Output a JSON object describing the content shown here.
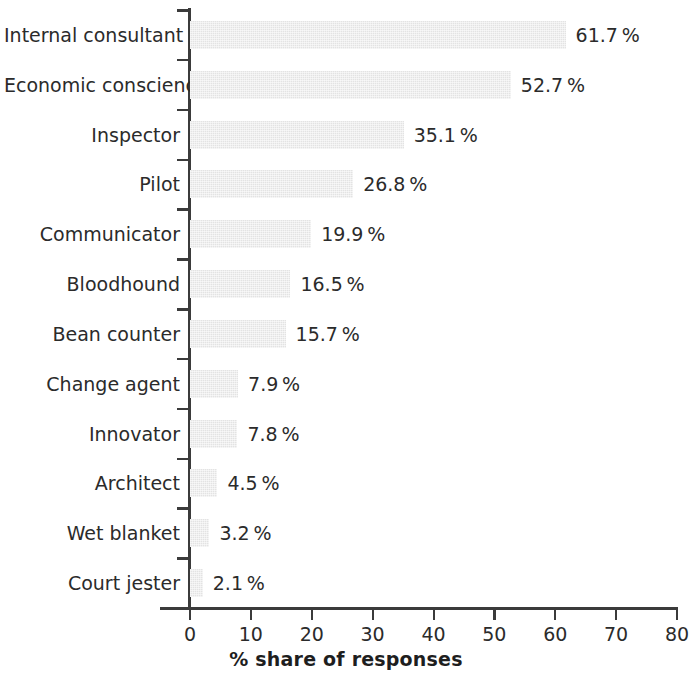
{
  "chart_data": {
    "type": "bar",
    "orientation": "horizontal",
    "title": "",
    "subtitle": "",
    "xlabel": "% share of responses",
    "ylabel": "",
    "xlim": [
      0,
      80
    ],
    "x_ticks": [
      0,
      10,
      20,
      30,
      40,
      50,
      60,
      70,
      80
    ],
    "x_tick_labels": [
      "0",
      "10",
      "20",
      "30",
      "40",
      "50",
      "60",
      "70",
      "80"
    ],
    "grid": false,
    "legend": null,
    "value_label_suffix": "%",
    "categories": [
      "Internal consultant",
      "Economic conscience",
      "Inspector",
      "Pilot",
      "Communicator",
      "Bloodhound",
      "Bean counter",
      "Change agent",
      "Innovator",
      "Architect",
      "Wet blanket",
      "Court jester"
    ],
    "values": [
      61.7,
      52.7,
      35.1,
      26.8,
      19.9,
      16.5,
      15.7,
      7.9,
      7.8,
      4.5,
      3.2,
      2.1
    ],
    "value_labels": [
      "61.7 %",
      "52.7 %",
      "35.1 %",
      "26.8 %",
      "19.9 %",
      "16.5 %",
      "15.7 %",
      "7.9 %",
      "7.8 %",
      "4.5 %",
      "3.2 %",
      "2.1 %"
    ],
    "colors": {
      "bar_fill": "#e3e3e3",
      "axis": "#3b3b3b",
      "text": "#2b2b2b",
      "background": "#ffffff"
    }
  }
}
